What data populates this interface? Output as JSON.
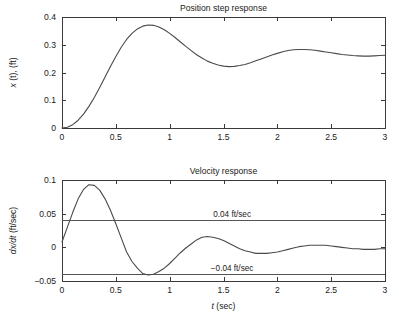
{
  "figure": {
    "background": "#ffffff",
    "line_color": "#4a4a4a",
    "axis_color": "#3a3a3a"
  },
  "chart_data": [
    {
      "type": "line",
      "id": "position-step-response",
      "title": "Position step response",
      "xlabel": "",
      "ylabel": "x(t), (ft)",
      "ylabel_parts": {
        "italic": "x",
        "rest": "(t), (ft)"
      },
      "xlim": [
        0,
        3
      ],
      "ylim": [
        0,
        0.4
      ],
      "grid": false,
      "legend": null,
      "xticks": [
        0,
        0.5,
        1,
        1.5,
        2,
        2.5,
        3
      ],
      "xticklabels": [
        "0",
        "0.5",
        "1",
        "1.5",
        "2",
        "2.5",
        "3"
      ],
      "yticks": [
        0,
        0.1,
        0.2,
        0.3,
        0.4
      ],
      "yticklabels": [
        "0",
        "0.1",
        "0.2",
        "0.3",
        "0.4"
      ],
      "series": [
        {
          "name": "x(t)",
          "color": "#4a4a4a",
          "x": [
            0.0,
            0.05,
            0.1,
            0.15,
            0.2,
            0.25,
            0.3,
            0.35,
            0.4,
            0.45,
            0.5,
            0.55,
            0.6,
            0.65,
            0.7,
            0.75,
            0.8,
            0.85,
            0.9,
            0.95,
            1.0,
            1.05,
            1.1,
            1.15,
            1.2,
            1.25,
            1.3,
            1.35,
            1.4,
            1.45,
            1.5,
            1.55,
            1.6,
            1.65,
            1.7,
            1.75,
            1.8,
            1.85,
            1.9,
            1.95,
            2.0,
            2.05,
            2.1,
            2.15,
            2.2,
            2.25,
            2.3,
            2.35,
            2.4,
            2.45,
            2.5,
            2.55,
            2.6,
            2.65,
            2.7,
            2.75,
            2.8,
            2.85,
            2.9,
            2.95,
            3.0
          ],
          "y": [
            0.0,
            0.003,
            0.012,
            0.028,
            0.05,
            0.078,
            0.11,
            0.146,
            0.184,
            0.222,
            0.258,
            0.291,
            0.319,
            0.341,
            0.357,
            0.367,
            0.371,
            0.37,
            0.364,
            0.354,
            0.341,
            0.326,
            0.31,
            0.294,
            0.279,
            0.264,
            0.252,
            0.241,
            0.233,
            0.227,
            0.223,
            0.221,
            0.222,
            0.225,
            0.229,
            0.235,
            0.242,
            0.249,
            0.256,
            0.263,
            0.269,
            0.275,
            0.279,
            0.282,
            0.283,
            0.283,
            0.282,
            0.28,
            0.277,
            0.274,
            0.271,
            0.268,
            0.265,
            0.263,
            0.261,
            0.26,
            0.259,
            0.259,
            0.26,
            0.261,
            0.262
          ]
        }
      ],
      "annotations": []
    },
    {
      "type": "line",
      "id": "velocity-response",
      "title": "Velocity response",
      "xlabel": "t (sec)",
      "xlabel_parts": {
        "italic": "t",
        "rest": "(sec)"
      },
      "ylabel": "dx/dt (ft/sec)",
      "ylabel_parts": {
        "italic": "dx/dt",
        "rest": "(ft/sec)"
      },
      "xlim": [
        0,
        3
      ],
      "ylim": [
        -0.05,
        0.1
      ],
      "grid": false,
      "legend": null,
      "xticks": [
        0,
        0.5,
        1,
        1.5,
        2,
        2.5,
        3
      ],
      "xticklabels": [
        "0",
        "0.5",
        "1",
        "1.5",
        "2",
        "2.5",
        "3"
      ],
      "yticks": [
        -0.05,
        0,
        0.05,
        0.1
      ],
      "yticklabels": [
        "−0.05",
        "0",
        "0.05",
        "0.1"
      ],
      "series": [
        {
          "name": "dx/dt",
          "color": "#4a4a4a",
          "x": [
            0.0,
            0.05,
            0.1,
            0.15,
            0.2,
            0.25,
            0.3,
            0.35,
            0.4,
            0.45,
            0.5,
            0.55,
            0.6,
            0.65,
            0.7,
            0.75,
            0.8,
            0.85,
            0.9,
            0.95,
            1.0,
            1.05,
            1.1,
            1.15,
            1.2,
            1.25,
            1.3,
            1.35,
            1.4,
            1.45,
            1.5,
            1.55,
            1.6,
            1.65,
            1.7,
            1.75,
            1.8,
            1.85,
            1.9,
            1.95,
            2.0,
            2.05,
            2.1,
            2.15,
            2.2,
            2.25,
            2.3,
            2.35,
            2.4,
            2.45,
            2.5,
            2.55,
            2.6,
            2.65,
            2.7,
            2.75,
            2.8,
            2.85,
            2.9,
            2.95,
            3.0
          ],
          "y": [
            0.008,
            0.03,
            0.052,
            0.072,
            0.086,
            0.093,
            0.092,
            0.085,
            0.072,
            0.055,
            0.035,
            0.014,
            -0.007,
            -0.021,
            -0.031,
            -0.039,
            -0.041,
            -0.04,
            -0.036,
            -0.031,
            -0.024,
            -0.016,
            -0.008,
            -0.001,
            0.005,
            0.011,
            0.015,
            0.016,
            0.015,
            0.013,
            0.01,
            0.006,
            0.002,
            -0.002,
            -0.005,
            -0.007,
            -0.009,
            -0.009,
            -0.009,
            -0.008,
            -0.007,
            -0.005,
            -0.003,
            -0.001,
            0.001,
            0.002,
            0.003,
            0.003,
            0.003,
            0.003,
            0.002,
            0.001,
            0.0,
            -0.001,
            -0.002,
            -0.002,
            -0.003,
            -0.003,
            -0.003,
            -0.002,
            -0.002
          ]
        }
      ],
      "reference_lines": [
        {
          "value": 0.04,
          "label": "0.04 ft/sec",
          "label_x": 1.58,
          "color": "#555555"
        },
        {
          "value": -0.04,
          "label": "−0.04 ft/sec",
          "label_x": 1.58,
          "color": "#555555"
        }
      ]
    }
  ]
}
